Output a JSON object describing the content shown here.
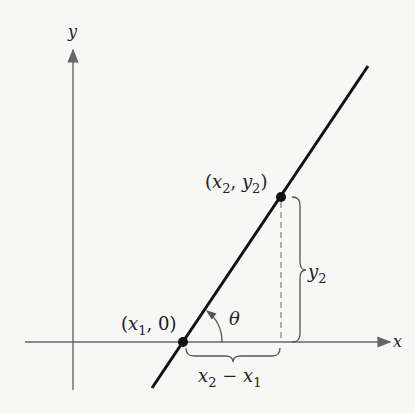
{
  "diagram": {
    "axes": {
      "x_label": "x",
      "y_label": "y"
    },
    "points": [
      {
        "label_open": "(",
        "var1": "x",
        "sub1": "1",
        "sep": ", ",
        "var2": "0",
        "close": ")"
      },
      {
        "label_open": "(",
        "var1": "x",
        "sub1": "2",
        "sep": ", ",
        "var2": "y",
        "sub2": "2",
        "close": ")"
      }
    ],
    "angle_label": "θ",
    "vertical_brace": {
      "var": "y",
      "sub": "2"
    },
    "horizontal_brace": {
      "var1": "x",
      "sub1": "2",
      "minus": " − ",
      "var2": "x",
      "sub2": "1"
    },
    "colors": {
      "axis": "#666666",
      "line": "#111111",
      "dashed": "#888888"
    }
  }
}
